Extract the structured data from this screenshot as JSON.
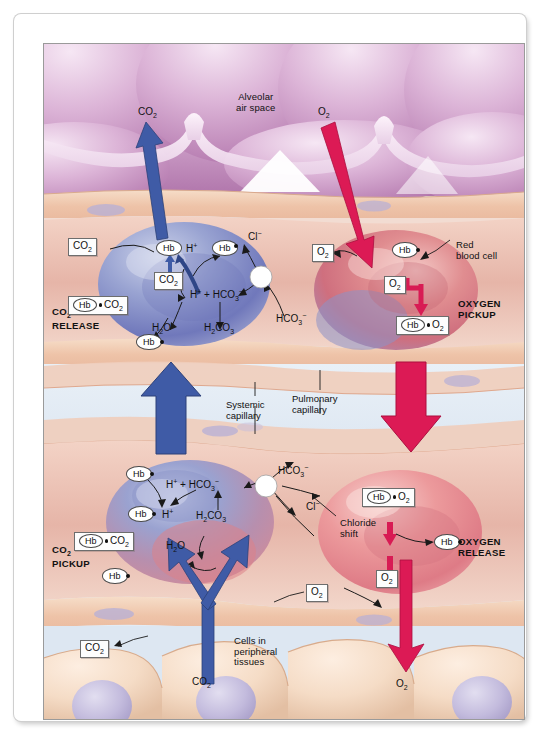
{
  "figure": {
    "colors": {
      "co2_arrow": "#3f5ba6",
      "o2_arrow": "#dc1a55",
      "alveolar_tissue": "#cf9fc8",
      "capillary_lumen": "#e3ecf5",
      "tissue_cell": "#f0cdb3",
      "deoxy_cell": "#7b86c4",
      "oxy_cell": "#e0707f"
    }
  },
  "regions": {
    "alveolar_air_space": "Alveolar\nair space",
    "alveolar_air_space_l1": "Alveolar",
    "alveolar_air_space_l2": "air space",
    "red_blood_cell_l1": "Red",
    "red_blood_cell_l2": "blood cell",
    "systemic_capillary_l1": "Systemic",
    "systemic_capillary_l2": "capillary",
    "pulmonary_capillary_l1": "Pulmonary",
    "pulmonary_capillary_l2": "capillary",
    "peripheral_cells_l1": "Cells in",
    "peripheral_cells_l2": "peripheral",
    "peripheral_cells_l3": "tissues",
    "chloride_shift_l1": "Chloride",
    "chloride_shift_l2": "shift"
  },
  "process_labels": {
    "co2_release_l1": "CO",
    "co2_release_sub": "2",
    "co2_release_l2": "RELEASE",
    "co2_pickup_l2": "PICKUP",
    "oxygen_pickup_l1": "OXYGEN",
    "oxygen_pickup_l2": "PICKUP",
    "oxygen_release_l1": "OXYGEN",
    "oxygen_release_l2": "RELEASE"
  },
  "species": {
    "co2": "CO2",
    "o2": "O2",
    "hb": "Hb",
    "h_plus": "H+",
    "hco3": "HCO3-",
    "h2co3": "H2CO3",
    "h2o": "H2O",
    "cl_minus": "Cl-",
    "hb_co2": "Hb CO2",
    "hb_h": "Hb H+",
    "hb_o2": "Hb O2"
  },
  "panels": {
    "co2_release": {
      "name": "CO2 RELEASE",
      "cell_type": "deoxygenated red blood cell",
      "nodes": [
        {
          "id": "co2-out-box",
          "text": "CO2",
          "kind": "box"
        },
        {
          "id": "co2-inner-box",
          "text": "CO2",
          "kind": "box"
        },
        {
          "id": "hbco2-box",
          "text": "Hb CO2",
          "kind": "box"
        },
        {
          "id": "hb-h-ellipse",
          "text": "Hb",
          "kind": "ellipse"
        },
        {
          "id": "h-plus-top",
          "text": "H+",
          "kind": "plain"
        },
        {
          "id": "hb-free-top",
          "text": "Hb",
          "kind": "ellipse"
        },
        {
          "id": "h-hco3",
          "text": "H+ + HCO3-",
          "kind": "plain"
        },
        {
          "id": "h2co3",
          "text": "H2CO3",
          "kind": "plain"
        },
        {
          "id": "h2o",
          "text": "H2O",
          "kind": "plain"
        },
        {
          "id": "hb-bottom",
          "text": "Hb",
          "kind": "ellipse"
        },
        {
          "id": "cl-minus",
          "text": "Cl-",
          "kind": "plain"
        },
        {
          "id": "hco3-out",
          "text": "HCO3-",
          "kind": "plain"
        }
      ]
    },
    "oxygen_pickup": {
      "name": "OXYGEN PICKUP",
      "cell_type": "oxygenating red blood cell",
      "nodes": [
        {
          "id": "o2-out-box",
          "text": "O2",
          "kind": "box"
        },
        {
          "id": "o2-in-box",
          "text": "O2",
          "kind": "box"
        },
        {
          "id": "hb-ellipse",
          "text": "Hb",
          "kind": "ellipse"
        },
        {
          "id": "hbo2-box",
          "text": "Hb O2",
          "kind": "box"
        }
      ]
    },
    "co2_pickup": {
      "name": "CO2 PICKUP",
      "cell_type": "deoxygenating red blood cell",
      "nodes": [
        {
          "id": "hb-top",
          "text": "Hb",
          "kind": "ellipse"
        },
        {
          "id": "h-hco3",
          "text": "H+ + HCO3-",
          "kind": "plain"
        },
        {
          "id": "hco3-out",
          "text": "HCO3-",
          "kind": "plain"
        },
        {
          "id": "hb-h-box",
          "text": "Hb H+",
          "kind": "ellipse"
        },
        {
          "id": "h2co3",
          "text": "H2CO3",
          "kind": "plain"
        },
        {
          "id": "cl-minus",
          "text": "Cl-",
          "kind": "plain"
        },
        {
          "id": "hbco2-box",
          "text": "Hb CO2",
          "kind": "box"
        },
        {
          "id": "h2o",
          "text": "H2O",
          "kind": "plain"
        },
        {
          "id": "hb-bottom",
          "text": "Hb",
          "kind": "ellipse"
        }
      ]
    },
    "oxygen_release": {
      "name": "OXYGEN RELEASE",
      "cell_type": "oxygenated red blood cell",
      "nodes": [
        {
          "id": "hbo2-box",
          "text": "Hb O2",
          "kind": "box"
        },
        {
          "id": "hb-ellipse",
          "text": "Hb",
          "kind": "ellipse"
        },
        {
          "id": "o2-box",
          "text": "O2",
          "kind": "box"
        },
        {
          "id": "o2-out-box",
          "text": "O2",
          "kind": "box"
        }
      ]
    }
  },
  "arrows": {
    "co2_to_alveolus": "CO2",
    "o2_from_alveolus": "O2",
    "co2_up_bulk": "CO2 bulk flow upward",
    "o2_down_bulk": "O2 bulk flow downward",
    "co2_from_tissue": "CO2",
    "o2_to_tissue": "O2"
  },
  "tissue_labels": {
    "co2_box_left": "CO2",
    "co2_arrow_base": "CO2",
    "o2_arrow_base": "O2",
    "co2_source_box": "CO2"
  }
}
